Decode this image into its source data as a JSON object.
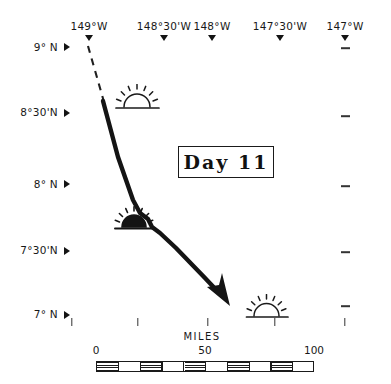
{
  "figure": {
    "title_box_label": "Day 11",
    "width": 391,
    "height": 384,
    "ink_color": "#1a1a1a",
    "background_color": "#ffffff"
  },
  "graticule": {
    "longitude_labels": [
      {
        "text": "149°W",
        "x": 89
      },
      {
        "text": "148°30'W",
        "x": 164
      },
      {
        "text": "148°W",
        "x": 212
      },
      {
        "text": "147°30'W",
        "x": 280
      },
      {
        "text": "147°W",
        "x": 345
      }
    ],
    "latitude_labels": [
      {
        "text": "9° N",
        "y": 47
      },
      {
        "text": "8°30'N",
        "y": 112
      },
      {
        "text": "8° N",
        "y": 184
      },
      {
        "text": "7°30'N",
        "y": 250
      },
      {
        "text": "7° N",
        "y": 314
      }
    ],
    "right_edge_ticks_y": [
      48,
      116,
      186,
      252,
      306
    ],
    "bottom_ticks_x": [
      72,
      138,
      208,
      275,
      345
    ]
  },
  "track": {
    "dashed_segment_note": "projected approach",
    "solid_segment_note": "observed vessel track",
    "arrow_note": "direction of travel"
  },
  "markers": [
    {
      "name": "sunrise-marker",
      "style": "outline",
      "x": 112,
      "y": 86,
      "width": 48
    },
    {
      "name": "sunset-marker",
      "style": "filled",
      "x": 114,
      "y": 210,
      "width": 44
    },
    {
      "name": "sunrise-marker-2",
      "style": "outline",
      "x": 243,
      "y": 297,
      "width": 46
    }
  ],
  "scale": {
    "caption": "MILES",
    "caption_x": 202,
    "ticks": [
      {
        "label": "0",
        "x": 96
      },
      {
        "label": "50",
        "x": 205
      },
      {
        "label": "100",
        "x": 314
      }
    ],
    "bar_left": 96,
    "bar_right": 314,
    "bar_top": 361,
    "bar_height": 10,
    "divisions": 10
  }
}
